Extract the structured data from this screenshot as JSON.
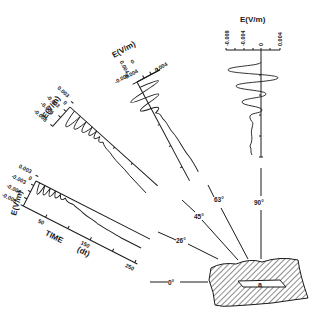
{
  "figure": {
    "y_axis_label": "E(V/m)",
    "x_axis_label": "TIME",
    "x_axis_unit": "(dt)",
    "x_ticks": [
      "50",
      "150",
      "250"
    ],
    "angles": [
      "0°",
      "26°",
      "45°",
      "63°",
      "90°"
    ],
    "panels": [
      {
        "angle": "26°",
        "y_ticks": [
          "0.003",
          "0",
          "-0.003",
          "-0.006",
          "-0.008"
        ]
      },
      {
        "angle": "45°",
        "y_ticks": [
          "0.003",
          "0",
          "-0.003",
          "-0.006",
          "-0.008"
        ]
      },
      {
        "angle": "63°",
        "y_ticks": [
          "0.004",
          "0",
          "-0.004",
          "-0.008"
        ]
      },
      {
        "angle": "90°",
        "y_ticks": [
          "-0.008",
          "-0.004",
          "0",
          "0.004"
        ]
      }
    ],
    "aperture_label": "a"
  }
}
